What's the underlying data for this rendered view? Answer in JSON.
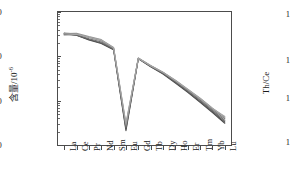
{
  "chart_data": {
    "type": "line",
    "title": "",
    "xlabel": "",
    "ylabel": "含量/10",
    "ylabel_exponent": "-6",
    "yscale": "log",
    "ylim": [
      1000,
      1000000
    ],
    "ytick_labels": [
      "1000",
      "10000",
      "100000",
      "1000000"
    ],
    "ytick_values": [
      1000,
      10000,
      100000,
      1000000
    ],
    "grid": false,
    "legend": "none",
    "categories": [
      "La",
      "Ce",
      "Pr",
      "Nd",
      "Sm",
      "Eu",
      "Gd",
      "Tb",
      "Dy",
      "Ho",
      "Er",
      "Tm",
      "Yb",
      "Lu"
    ],
    "series": [
      {
        "name": "sample-1",
        "color": "#4a4a4a",
        "values": [
          330000,
          300000,
          235000,
          195000,
          140000,
          2100,
          88000,
          58000,
          40000,
          25000,
          15500,
          9200,
          5400,
          3100
        ]
      },
      {
        "name": "sample-2",
        "color": "#5a5a5a",
        "values": [
          320000,
          298000,
          240000,
          200000,
          142000,
          2300,
          89000,
          59000,
          41000,
          26000,
          16000,
          9600,
          5700,
          3300
        ]
      },
      {
        "name": "sample-3",
        "color": "#6e6e6e",
        "values": [
          310000,
          305000,
          250000,
          210000,
          148000,
          2500,
          90000,
          60000,
          42000,
          27000,
          16800,
          10200,
          6000,
          3600
        ]
      },
      {
        "name": "sample-4",
        "color": "#828282",
        "values": [
          335000,
          320000,
          265000,
          225000,
          152000,
          2700,
          91000,
          61000,
          43000,
          28000,
          17500,
          10800,
          6400,
          3900
        ]
      },
      {
        "name": "sample-5",
        "color": "#949494",
        "values": [
          325000,
          330000,
          278000,
          238000,
          158000,
          2900,
          92000,
          62000,
          44000,
          29000,
          18200,
          11400,
          6800,
          4200
        ]
      },
      {
        "name": "sample-6",
        "color": "#a6a6a6",
        "values": [
          300000,
          315000,
          270000,
          232000,
          155000,
          3100,
          90500,
          61500,
          43500,
          28500,
          18000,
          11200,
          6700,
          4400
        ]
      }
    ]
  },
  "right_panel": {
    "axis_title": "Th/Ce",
    "tick_labels": [
      "1",
      "1",
      "1",
      "1"
    ],
    "tick_positions_px": [
      14,
      60,
      98,
      142
    ]
  }
}
